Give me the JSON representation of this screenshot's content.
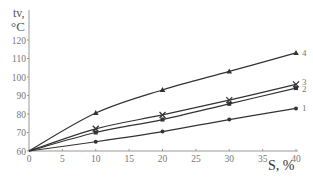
{
  "chart_data": {
    "type": "line",
    "title": "",
    "ylabel_line1": "tv,",
    "ylabel_line2": "°C",
    "xlabel": "S, %",
    "x": [
      0,
      10,
      20,
      30,
      40
    ],
    "xticks": [
      0,
      5,
      10,
      15,
      20,
      25,
      30,
      35,
      40
    ],
    "yticks": [
      60,
      70,
      80,
      90,
      100,
      110,
      120
    ],
    "xlim": [
      0,
      40
    ],
    "ylim": [
      60,
      120
    ],
    "grid": false,
    "legend": "inline numeric labels at line ends",
    "series": [
      {
        "name": "1",
        "marker": "circle",
        "values": [
          60,
          65,
          70.5,
          77,
          83
        ]
      },
      {
        "name": "2",
        "marker": "square",
        "values": [
          60,
          70,
          77,
          85.5,
          94
        ]
      },
      {
        "name": "3",
        "marker": "cross",
        "values": [
          60,
          72,
          79.5,
          87.5,
          96
        ]
      },
      {
        "name": "4",
        "marker": "triangle",
        "values": [
          60,
          80.5,
          93,
          103,
          113
        ]
      }
    ]
  },
  "colors": {
    "line": "#333333",
    "axis": "#999999",
    "text": "#555555"
  }
}
